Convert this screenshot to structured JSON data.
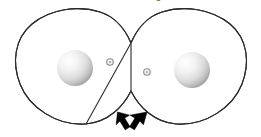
{
  "figure": {
    "name": "contact-binary-roche-lobe-diagram",
    "background_color": "#ffffff",
    "width": 261,
    "height": 137,
    "outline_color": "#2b2b2b",
    "outline_width": 1.1,
    "clipped_caption_fragments": [
      {
        "text": "·",
        "x": 92
      },
      {
        "text": "·",
        "x": 122
      },
      {
        "text": "g",
        "x": 156
      }
    ],
    "lobes": [
      {
        "id": "left-lobe",
        "label": "left Roche lobe",
        "center_x": 72,
        "center_y": 67,
        "radius_x": 59,
        "radius_y": 57
      },
      {
        "id": "right-lobe",
        "label": "right Roche lobe",
        "center_x": 190,
        "center_y": 67,
        "radius_x": 59,
        "radius_y": 57
      }
    ],
    "cusps": [
      {
        "id": "upper-cusp",
        "x": 131,
        "y": 43
      },
      {
        "id": "lower-cusp",
        "x": 131,
        "y": 91
      }
    ],
    "spheres": [
      {
        "id": "left-star",
        "label": "primary star",
        "center_x": 75,
        "center_y": 68,
        "radius": 18,
        "highlight_x": 68,
        "highlight_y": 61,
        "highlight_color": "#ffffff",
        "mid_color": "#e3e3e3",
        "edge_color": "#a8a8a8"
      },
      {
        "id": "right-star",
        "label": "secondary star",
        "center_x": 192,
        "center_y": 70,
        "radius": 18,
        "highlight_x": 185,
        "highlight_y": 63,
        "highlight_color": "#ffffff",
        "mid_color": "#e3e3e3",
        "edge_color": "#a8a8a8"
      }
    ],
    "markers": [
      {
        "id": "left-center-of-mass-marker",
        "label": "inner marker left",
        "center_x": 110,
        "center_y": 62,
        "outer_radius": 3.2,
        "inner_radius": 1.5,
        "ring_color": "#8c8c8c",
        "fill_color": "#ffffff"
      },
      {
        "id": "right-center-of-mass-marker",
        "label": "inner marker right",
        "center_x": 147,
        "center_y": 72,
        "outer_radius": 3.2,
        "inner_radius": 1.5,
        "ring_color": "#8c8c8c",
        "fill_color": "#ffffff"
      }
    ],
    "arrows": [
      {
        "id": "left-pointer-arrow",
        "label": "arrow pointing up-left",
        "tip_x": 120,
        "tip_y": 113,
        "color": "#000000",
        "rotation_deg": -45
      },
      {
        "id": "right-pointer-arrow",
        "label": "arrow pointing up-right",
        "tip_x": 144,
        "tip_y": 113,
        "color": "#000000",
        "rotation_deg": 45
      }
    ]
  }
}
